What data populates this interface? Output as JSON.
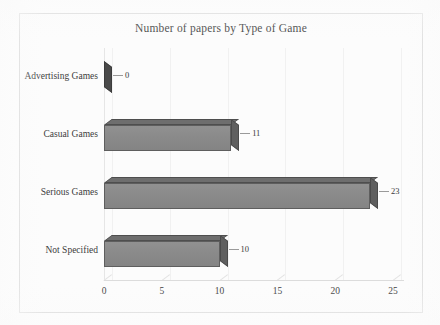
{
  "chart_data": {
    "type": "bar",
    "orientation": "horizontal",
    "style": "3d-clustered-bar",
    "title": "Number of papers by Type of Game",
    "xlabel": "",
    "ylabel": "",
    "categories": [
      "Advertising Games",
      "Casual Games",
      "Serious Games",
      "Not Specified"
    ],
    "values": [
      0,
      11,
      23,
      10
    ],
    "data_labels": [
      "0",
      "11",
      "23",
      "10"
    ],
    "xticks": [
      0,
      5,
      10,
      15,
      20,
      25
    ],
    "xtick_labels": [
      "0",
      "5",
      "10",
      "15",
      "20",
      "25"
    ],
    "xlim": [
      0,
      26
    ],
    "grid": true,
    "legend": false,
    "series": [
      {
        "name": "Number of papers",
        "values": [
          0,
          11,
          23,
          10
        ]
      }
    ],
    "colors": {
      "bar_front": "#8d8d8d",
      "bar_top": "#6e6e6e",
      "bar_cap": "#5f5f5f",
      "background": "#fcfcfc",
      "frame": "#d8d8d8",
      "gridline": "#f1f1f1",
      "text": "#3a3a3a"
    }
  }
}
